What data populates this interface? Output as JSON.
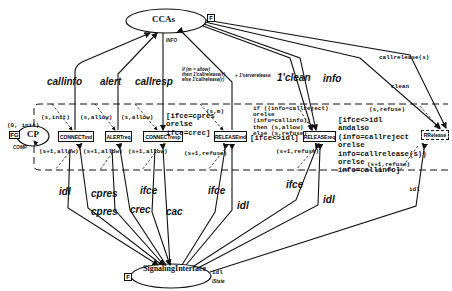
{
  "places": {
    "ccas": {
      "label": "CCAs",
      "tag": "F",
      "type_label": "INFO"
    },
    "cp": {
      "label": "CP",
      "tag": "FG",
      "init": "(0, init)",
      "type_label": "COMP"
    },
    "signalling_interface": {
      "label": "SignalingInterface",
      "tag": "F",
      "init": "idl",
      "type_label": "IState"
    }
  },
  "transitions": [
    {
      "id": "connect_ind",
      "label": "CONNECTind"
    },
    {
      "id": "alert_req",
      "label": "ALERTreq"
    },
    {
      "id": "connect_resp",
      "label": "CONNECTresp"
    },
    {
      "id": "release_ind",
      "label": "RELEASEind"
    },
    {
      "id": "release_req",
      "label": "RELEASEreq"
    },
    {
      "id": "rrelease",
      "label": "RRelease"
    }
  ],
  "arc_labels_top": {
    "callinfo": "callinfo",
    "alert": "alert",
    "callresp": "callresp",
    "conditional": [
      "if (m = allow)",
      "then 1'callrelease(r)",
      "else 1'callrelease(r)"
    ],
    "serverelease": "+ 1'serverelease",
    "clean_1": "1'clean",
    "info": "info",
    "callrelease": "callrelease(s)",
    "clean": "clean"
  },
  "arc_labels_bottom": {
    "idl_1": "idl",
    "cpres_1": "cpres",
    "cpres_2": "cpres",
    "crec": "crec",
    "ifce_1": "ifce",
    "cac": "cac",
    "ifce_2": "ifce",
    "idl_2": "idl",
    "ifce_3": "ifce",
    "idl_3": "idl",
    "idl_4": "idl"
  },
  "cp_arcs": {
    "in_connect_ind": "(s,init)",
    "out_connect_ind": "(s+1,allow)",
    "in_alert": "(s,allow)",
    "out_alert": "(s+1,allow)",
    "in_connect_resp": "(s,allow)",
    "out_connect_resp": "(s+1,allow)",
    "in_release_ind": "(s,m)",
    "out_release_ind": "(s+1,refuse)",
    "in_rrelease": "(s,refuse)",
    "out_release_req": "(s+1,refuse)",
    "out_rrelease": "(s+1,refuse)"
  },
  "guards": {
    "connect_resp": [
      "[ifce=cpres",
      "orelse",
      "ifce=crec]"
    ],
    "release_ind": "[ifce<>idl]",
    "release_ind_if": [
      "if ((info=callreject)",
      "orelse",
      "(info=callinfo))",
      "then (s,allow)",
      "else (s,refuse)"
    ],
    "release_req": [
      "[ifce<>idl",
      "andalso",
      "(info=callreject",
      "orelse",
      "info=callrelease(s))",
      "orelse",
      "info=callinfo]"
    ]
  }
}
